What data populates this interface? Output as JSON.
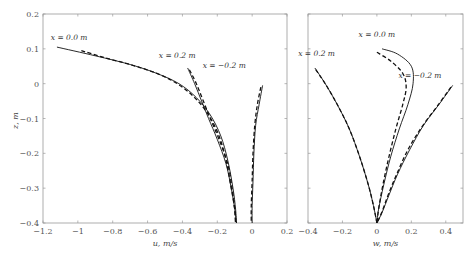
{
  "chart_data": [
    {
      "type": "line",
      "panel": "left",
      "title": "",
      "xlabel": "u, m/s",
      "ylabel": "z, m",
      "xlim": [
        -1.2,
        0.2
      ],
      "ylim": [
        -0.4,
        0.2
      ],
      "xticks": [
        -1.2,
        -1,
        -0.8,
        -0.6,
        -0.4,
        -0.2,
        0,
        0.2
      ],
      "xtick_labels": [
        "-1.2",
        "-1",
        "-0.8",
        "-0.6",
        "-0.4",
        "-0.2",
        "0",
        "0.2"
      ],
      "yticks": [
        0.2,
        0.1,
        0,
        -0.1,
        -0.2,
        -0.3,
        -0.4
      ],
      "ytick_labels": [
        "0.2",
        "0.1",
        "0",
        "-0.1",
        "-0.2",
        "-0.3",
        "-0.4"
      ],
      "grid": false,
      "legend": "none",
      "annotations": [
        {
          "text": "x = 0.0 m",
          "x": -1.05,
          "y": 0.125
        },
        {
          "text": "x = 0.2 m",
          "x": -0.43,
          "y": 0.075
        },
        {
          "text": "x = −0.2 m",
          "x": -0.16,
          "y": 0.045
        }
      ],
      "series": [
        {
          "name": "x = 0.0 m (solid)",
          "style": "solid",
          "x": [
            -1.12,
            -0.9,
            -0.7,
            -0.55,
            -0.42,
            -0.32,
            -0.24,
            -0.18,
            -0.14,
            -0.11,
            -0.095,
            -0.09
          ],
          "y": [
            0.105,
            0.08,
            0.055,
            0.03,
            0.0,
            -0.04,
            -0.09,
            -0.15,
            -0.22,
            -0.3,
            -0.36,
            -0.4
          ]
        },
        {
          "name": "x = 0.0 m (dashed)",
          "style": "dashed",
          "x": [
            -0.98,
            -0.85,
            -0.7,
            -0.55,
            -0.43,
            -0.33,
            -0.25,
            -0.19,
            -0.15,
            -0.12,
            -0.1,
            -0.095
          ],
          "y": [
            0.095,
            0.075,
            0.055,
            0.03,
            0.0,
            -0.04,
            -0.09,
            -0.15,
            -0.22,
            -0.3,
            -0.36,
            -0.4
          ]
        },
        {
          "name": "x = 0.2 m (solid)",
          "style": "solid",
          "x": [
            -0.37,
            -0.33,
            -0.29,
            -0.25,
            -0.2,
            -0.15,
            -0.12,
            -0.1,
            -0.09
          ],
          "y": [
            0.045,
            0.0,
            -0.05,
            -0.1,
            -0.16,
            -0.23,
            -0.3,
            -0.36,
            -0.4
          ]
        },
        {
          "name": "x = 0.2 m (dashed)",
          "style": "dashed",
          "x": [
            -0.36,
            -0.32,
            -0.28,
            -0.24,
            -0.19,
            -0.14,
            -0.115,
            -0.1,
            -0.095
          ],
          "y": [
            0.04,
            0.0,
            -0.05,
            -0.1,
            -0.16,
            -0.23,
            -0.3,
            -0.36,
            -0.4
          ]
        },
        {
          "name": "x = −0.2 m (solid)",
          "style": "solid",
          "x": [
            0.06,
            0.04,
            0.02,
            0.01,
            0.005,
            0.0,
            0.0
          ],
          "y": [
            -0.005,
            -0.06,
            -0.12,
            -0.2,
            -0.28,
            -0.35,
            -0.4
          ]
        },
        {
          "name": "x = −0.2 m (dashed)",
          "style": "dashed",
          "x": [
            0.05,
            0.03,
            0.015,
            0.005,
            0.0,
            -0.005,
            -0.005
          ],
          "y": [
            -0.01,
            -0.06,
            -0.12,
            -0.2,
            -0.28,
            -0.35,
            -0.4
          ]
        }
      ]
    },
    {
      "type": "line",
      "panel": "right",
      "title": "",
      "xlabel": "w, m/s",
      "ylabel": "",
      "xlim": [
        -0.4,
        0.5
      ],
      "ylim": [
        -0.4,
        0.2
      ],
      "xticks": [
        -0.4,
        -0.2,
        0,
        0.2,
        0.4
      ],
      "xtick_labels": [
        "-0.4",
        "-0.2",
        "0",
        "0.2",
        "0.4"
      ],
      "grid": false,
      "legend": "none",
      "annotations": [
        {
          "text": "x = 0.0 m",
          "x": 0.0,
          "y": 0.135
        },
        {
          "text": "x = 0.2 m",
          "x": -0.35,
          "y": 0.08
        },
        {
          "text": "x = −0.2 m",
          "x": 0.25,
          "y": 0.015
        }
      ],
      "series": [
        {
          "name": "x = 0.0 m (solid)",
          "style": "solid",
          "x": [
            0.03,
            0.12,
            0.2,
            0.21,
            0.18,
            0.13,
            0.08,
            0.04,
            0.01,
            0.0
          ],
          "y": [
            0.1,
            0.085,
            0.05,
            0.0,
            -0.06,
            -0.13,
            -0.21,
            -0.29,
            -0.36,
            -0.4
          ]
        },
        {
          "name": "x = 0.0 m (dashed)",
          "style": "dashed",
          "x": [
            0.0,
            0.08,
            0.15,
            0.17,
            0.15,
            0.11,
            0.07,
            0.035,
            0.01,
            0.0
          ],
          "y": [
            0.09,
            0.065,
            0.03,
            -0.01,
            -0.06,
            -0.13,
            -0.21,
            -0.29,
            -0.36,
            -0.4
          ]
        },
        {
          "name": "x = 0.2 m (solid)",
          "style": "solid",
          "x": [
            -0.36,
            -0.3,
            -0.23,
            -0.16,
            -0.1,
            -0.05,
            -0.02,
            0.0
          ],
          "y": [
            0.045,
            0.0,
            -0.06,
            -0.13,
            -0.21,
            -0.29,
            -0.35,
            -0.4
          ]
        },
        {
          "name": "x = 0.2 m (dashed)",
          "style": "dashed",
          "x": [
            -0.355,
            -0.3,
            -0.23,
            -0.16,
            -0.1,
            -0.05,
            -0.02,
            0.0
          ],
          "y": [
            0.04,
            0.0,
            -0.06,
            -0.13,
            -0.21,
            -0.29,
            -0.35,
            -0.4
          ]
        },
        {
          "name": "x = −0.2 m (solid)",
          "style": "solid",
          "x": [
            0.44,
            0.36,
            0.27,
            0.19,
            0.12,
            0.07,
            0.03,
            0.0
          ],
          "y": [
            -0.005,
            -0.06,
            -0.12,
            -0.19,
            -0.26,
            -0.32,
            -0.37,
            -0.4
          ]
        },
        {
          "name": "x = −0.2 m (dashed)",
          "style": "dashed",
          "x": [
            0.43,
            0.35,
            0.26,
            0.18,
            0.115,
            0.065,
            0.028,
            0.0
          ],
          "y": [
            -0.01,
            -0.065,
            -0.125,
            -0.19,
            -0.26,
            -0.32,
            -0.37,
            -0.4
          ]
        }
      ]
    }
  ],
  "layout": {
    "left": {
      "x0": 43,
      "x1": 287,
      "y0": 14,
      "y1": 223
    },
    "right": {
      "x0": 308,
      "x1": 463,
      "y0": 14,
      "y1": 223
    }
  }
}
